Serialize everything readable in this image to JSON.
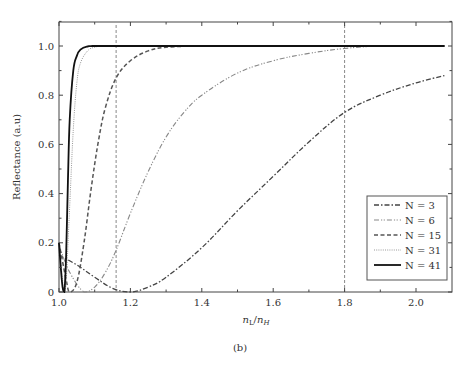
{
  "chart_data": {
    "type": "line",
    "title": "",
    "subtitle": "(b)",
    "xlabel": "n_L/n_H",
    "xlabel_parts": {
      "n1": "n",
      "s1": "L",
      "slash": "/",
      "n2": "n",
      "s2": "H"
    },
    "ylabel": "Reflectance (a.u)",
    "xlim": [
      1.0,
      2.1
    ],
    "ylim": [
      0,
      1.1
    ],
    "x_ticks": [
      1.0,
      1.2,
      1.4,
      1.6,
      1.8,
      2.0
    ],
    "x_tick_labels": [
      "1.0",
      "1.2",
      "1.4",
      "1.6",
      "1.8",
      "2.0"
    ],
    "y_ticks": [
      0,
      0.2,
      0.4,
      0.6,
      0.8,
      1.0
    ],
    "y_tick_labels": [
      "0",
      "0.2",
      "0.4",
      "0.6",
      "0.8",
      "1.0"
    ],
    "grid": false,
    "legend_position": "lower right",
    "reference_lines": [
      {
        "type": "vertical",
        "x": 1.16,
        "style": "dashed"
      },
      {
        "type": "vertical",
        "x": 1.8,
        "style": "dashed"
      }
    ],
    "series": [
      {
        "name": "N = 3",
        "style": "dash-dot",
        "color": "#444444",
        "x": [
          1.0,
          1.05,
          1.1,
          1.15,
          1.2,
          1.25,
          1.3,
          1.4,
          1.5,
          1.6,
          1.7,
          1.8,
          1.9,
          2.0,
          2.08
        ],
        "y": [
          0.15,
          0.11,
          0.06,
          0.015,
          0.0,
          0.02,
          0.06,
          0.18,
          0.33,
          0.47,
          0.61,
          0.73,
          0.8,
          0.85,
          0.88
        ]
      },
      {
        "name": "N = 6",
        "style": "dash-dot-dot",
        "color": "#888888",
        "x": [
          1.0,
          1.03,
          1.07,
          1.1,
          1.13,
          1.16,
          1.2,
          1.25,
          1.3,
          1.35,
          1.4,
          1.5,
          1.6,
          1.7,
          1.8,
          1.9,
          2.0,
          2.08
        ],
        "y": [
          0.19,
          0.08,
          0.0,
          0.02,
          0.08,
          0.17,
          0.32,
          0.49,
          0.63,
          0.73,
          0.8,
          0.89,
          0.94,
          0.97,
          0.99,
          1.0,
          1.0,
          1.0
        ]
      },
      {
        "name": "N = 15",
        "style": "dashed",
        "color": "#555555",
        "x": [
          1.0,
          1.02,
          1.03,
          1.05,
          1.07,
          1.09,
          1.11,
          1.13,
          1.16,
          1.2,
          1.25,
          1.3,
          1.4,
          1.5,
          2.08
        ],
        "y": [
          0.2,
          0.05,
          0.0,
          0.04,
          0.2,
          0.42,
          0.61,
          0.75,
          0.87,
          0.94,
          0.98,
          0.995,
          1.0,
          1.0,
          1.0
        ]
      },
      {
        "name": "N = 31",
        "style": "dotted",
        "color": "#999999",
        "x": [
          1.0,
          1.01,
          1.015,
          1.02,
          1.03,
          1.04,
          1.05,
          1.06,
          1.08,
          1.1,
          1.13,
          1.2,
          2.08
        ],
        "y": [
          0.2,
          0.05,
          0.0,
          0.04,
          0.35,
          0.66,
          0.85,
          0.93,
          0.98,
          0.995,
          1.0,
          1.0,
          1.0
        ]
      },
      {
        "name": "N = 41",
        "style": "solid",
        "color": "#111111",
        "x": [
          1.0,
          1.005,
          1.01,
          1.015,
          1.02,
          1.025,
          1.03,
          1.04,
          1.05,
          1.06,
          1.08,
          1.1,
          1.2,
          2.08
        ],
        "y": [
          0.2,
          0.1,
          0.02,
          0.0,
          0.15,
          0.45,
          0.7,
          0.9,
          0.96,
          0.985,
          0.998,
          1.0,
          1.0,
          1.0
        ]
      }
    ],
    "legend": [
      "N = 3",
      "N = 6",
      "N = 15",
      "N = 31",
      "N = 41"
    ]
  }
}
